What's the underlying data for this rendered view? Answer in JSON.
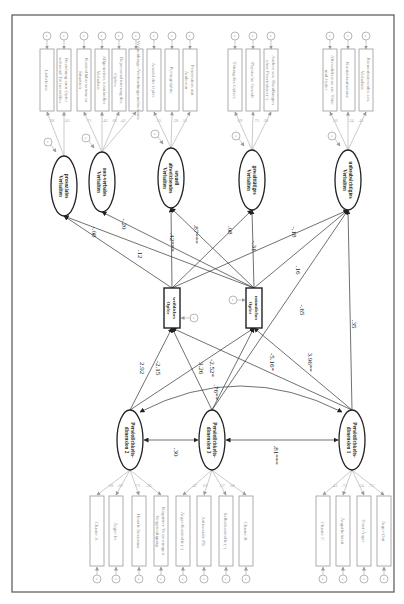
{
  "diagram": {
    "type": "structural-equation-model",
    "orientation": "rotated-90-clockwise",
    "outcome_latents": [
      {
        "id": "o1",
        "label": [
          "prosoziales",
          "Verhalten"
        ],
        "indicators": [
          "Liebeleien",
          "Beziehung zum Opfer während Tat herstellen"
        ],
        "loadings": [
          ".28",
          ".05"
        ]
      },
      {
        "id": "o2",
        "label": [
          "non-verbales",
          "Verhalten"
        ],
        "indicators": [
          "Kontrollübernahme in Situation",
          "Allgemeines kriminelles Verhalten",
          "Depersonalisierung des Opfers",
          "Vermeidungs-/Verbindungsmaßnahmen"
        ],
        "loadings": [
          ".71",
          ".42",
          ".61",
          ".41"
        ]
      },
      {
        "id": "o3",
        "label": [
          "sexuell",
          "abweichendes",
          "Verhalten"
        ],
        "indicators": [
          "Anzahl der Opfer",
          "Pornographie",
          "Penetration mit Anderem"
        ],
        "loadings": [
          ".55",
          ".38",
          ".12"
        ]
      },
      {
        "id": "o4",
        "label": [
          "gewalttätiges",
          "Verhalten"
        ],
        "indicators": [
          "Tötung des Opfers",
          "Physische Gewalt",
          "Andere sex. Handlungen ohne Penetration (-)"
        ],
        "loadings": [
          ".69",
          ".75",
          ".58"
        ]
      },
      {
        "id": "o5",
        "label": [
          "unbeabsichtigtes",
          "Verhalten"
        ],
        "indicators": [
          "Altersdifferenz zw. Täter und Opfer",
          "Kontaktaufnahme",
          "Romantisierendes sex. Verhalten"
        ],
        "loadings": [
          ".56",
          ".34",
          ".41"
        ]
      }
    ],
    "mediators": [
      {
        "id": "m1",
        "label": [
          "weibliches",
          "Opfer"
        ]
      },
      {
        "id": "m2",
        "label": [
          "männliches",
          "Opfer"
        ]
      }
    ],
    "predictor_latents": [
      {
        "id": "p2",
        "label": [
          "Persönlichkeits-",
          "dimension 2"
        ],
        "indicators": [
          "Cluster A",
          "Ärger-In",
          "Hostile Sexismus",
          "Kognitive Verzerrungen Vergewaltigung"
        ],
        "loadings": [
          ".28",
          ".39",
          ".72",
          ".58"
        ]
      },
      {
        "id": "p3",
        "label": [
          "Persönlichkeits-",
          "dimension 3"
        ],
        "indicators": [
          "Ärger-Kontrolle (-)",
          "Antisoziale PS",
          "Selbstkontrolle (-)",
          "Cluster B"
        ],
        "loadings": [
          ".47",
          ".61",
          ".57",
          ".68"
        ]
      },
      {
        "id": "p1",
        "label": [
          "Persönlichkeits-",
          "dimension 1"
        ],
        "indicators": [
          "Cluster C",
          "Ängstlichkeit",
          "Trait-Ärger",
          "Ärger-Out"
        ],
        "loadings": [
          ".43",
          ".71",
          ".54",
          ".73"
        ]
      }
    ],
    "paths": [
      {
        "from": "m1",
        "to": "o1",
        "coef": ".12"
      },
      {
        "from": "m2",
        "to": "o1",
        "coef": "-.08"
      },
      {
        "from": "m2",
        "to": "o2",
        "coef": "-.20"
      },
      {
        "from": "m1",
        "to": "o3",
        "coef": ".42***"
      },
      {
        "from": "m2",
        "to": "o3",
        "coef": ".87***"
      },
      {
        "from": "m1",
        "to": "o4",
        "coef": ".08"
      },
      {
        "from": "m2",
        "to": "o4",
        "coef": "-.31"
      },
      {
        "from": "m1",
        "to": "o5",
        "coef": "-.18"
      },
      {
        "from": "m2",
        "to": "o5",
        "coef": ".16"
      },
      {
        "from": "p3",
        "to": "o5",
        "coef": "-.65"
      },
      {
        "from": "p1",
        "to": "o5",
        "coef": ".35"
      },
      {
        "from": "p2",
        "to": "m1",
        "coef": "2.92"
      },
      {
        "from": "p2",
        "to": "m2",
        "coef": "-2.15"
      },
      {
        "from": "p3",
        "to": "m1",
        "coef": "3.26"
      },
      {
        "from": "p3",
        "to": "m2",
        "coef": "-2.52*"
      },
      {
        "from": "p1",
        "to": "m1",
        "coef": "-5.16*"
      },
      {
        "from": "p1",
        "to": "m2",
        "coef": "3.96**"
      }
    ],
    "correlations": [
      {
        "a": "p2",
        "b": "p3",
        "coef": ".30"
      },
      {
        "a": "p3",
        "b": "p1",
        "coef": ".81***"
      },
      {
        "a": "p2",
        "b": "p1",
        "coef": ".76**"
      }
    ],
    "residual_label": "e"
  }
}
